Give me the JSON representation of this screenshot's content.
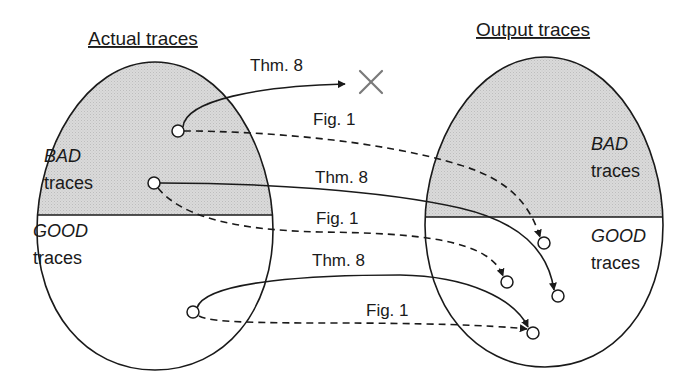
{
  "titles": {
    "left": "Actual traces",
    "right": "Output traces"
  },
  "left_set": {
    "bad_label_1": "BAD",
    "bad_label_2": "traces",
    "good_label_1": "GOOD",
    "good_label_2": "traces"
  },
  "right_set": {
    "bad_label_1": "BAD",
    "bad_label_2": "traces",
    "good_label_1": "GOOD",
    "good_label_2": "traces"
  },
  "edges": [
    {
      "id": "bad1-thm8",
      "label": "Thm. 8",
      "style": "solid",
      "target": "rejected (X)"
    },
    {
      "id": "bad1-fig1",
      "label": "Fig. 1",
      "style": "dashed",
      "target": "output GOOD trace"
    },
    {
      "id": "bad2-thm8",
      "label": "Thm. 8",
      "style": "solid",
      "target": "output GOOD trace"
    },
    {
      "id": "bad2-fig1",
      "label": "Fig. 1",
      "style": "dashed",
      "target": "output GOOD trace"
    },
    {
      "id": "good1-thm8",
      "label": "Thm. 8",
      "style": "solid",
      "target": "output GOOD trace"
    },
    {
      "id": "good1-fig1",
      "label": "Fig. 1",
      "style": "dashed",
      "target": "output GOOD trace"
    }
  ],
  "colors": {
    "bad_fill": "#d6d6d6",
    "stroke": "#1a1a1a",
    "x_mark": "#7a7a7a"
  }
}
